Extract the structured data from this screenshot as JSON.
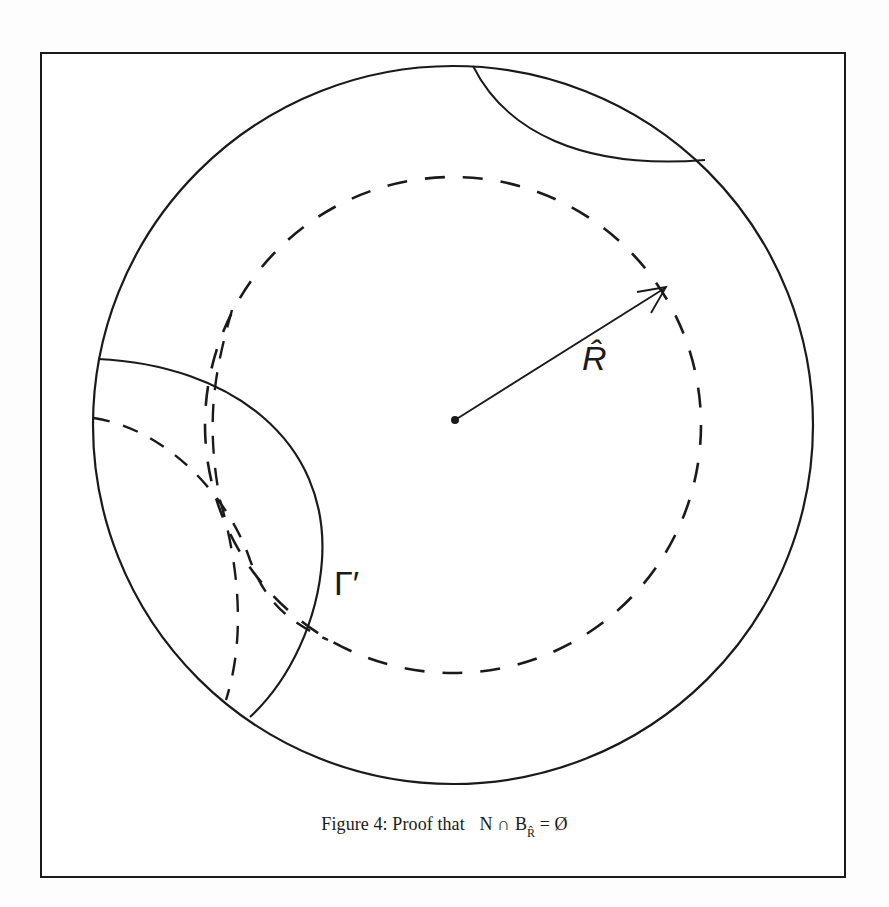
{
  "figure": {
    "caption_prefix": "Figure 4:  Proof that",
    "caption_math_N": "N",
    "caption_math_cap": "∩",
    "caption_math_B": "B",
    "caption_math_subscript": "R̂",
    "caption_math_eq": "= Ø",
    "labels": {
      "radius": "R̂",
      "curve": "Γ′"
    },
    "colors": {
      "ink": "#1a1a1a",
      "paper": "#ffffff",
      "background": "#fdfdfd"
    }
  }
}
